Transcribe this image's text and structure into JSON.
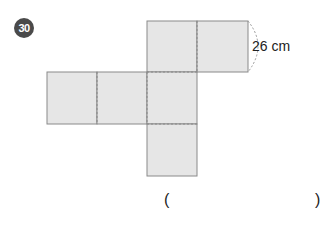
{
  "problem": {
    "number": "30",
    "dimension_label": "26 cm",
    "answer_open": "(",
    "answer_close": ")"
  },
  "figure": {
    "type": "cube-net",
    "square_count": 6,
    "fill_color": "#e6e6e6",
    "edge_color": "#8a8a8a"
  }
}
